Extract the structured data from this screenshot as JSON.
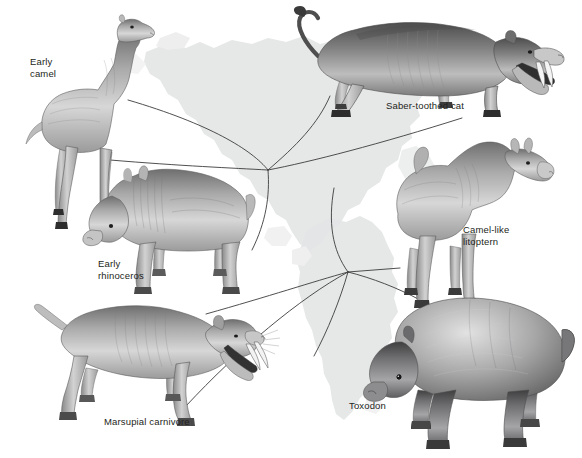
{
  "figure": {
    "background_color": "#ffffff",
    "ink_color": "#231f20",
    "map_fill": "#e2e3e4",
    "line_color": "#3a3a3a"
  },
  "labels": {
    "early_camel": "Early\ncamel",
    "saber_toothed_cat": "Saber-toothed cat",
    "early_rhinoceros": "Early\nrhinoceros",
    "camel_like_litoptern": "Camel-like\nlitoptern",
    "marsupial_carnivore": "Marsupial carnivore",
    "toxodon": "Toxodon"
  },
  "animals": [
    {
      "id": "early-camel",
      "label": "Early camel",
      "continent": "North America",
      "facing": "right"
    },
    {
      "id": "saber-toothed-cat",
      "label": "Saber-toothed cat",
      "continent": "North America",
      "facing": "right"
    },
    {
      "id": "early-rhinoceros",
      "label": "Early rhinoceros",
      "continent": "North America",
      "facing": "left"
    },
    {
      "id": "camel-like-litoptern",
      "label": "Camel-like litoptern",
      "continent": "South America",
      "facing": "right"
    },
    {
      "id": "marsupial-carnivore",
      "label": "Marsupial carnivore",
      "continent": "South America",
      "facing": "right"
    },
    {
      "id": "toxodon",
      "label": "Toxodon",
      "continent": "South America",
      "facing": "left"
    }
  ],
  "maps": [
    {
      "id": "north-america-silhouette",
      "label": "North America"
    },
    {
      "id": "south-america-silhouette",
      "label": "South America"
    }
  ],
  "hubs": [
    {
      "id": "north-america-hub",
      "x": 268,
      "y": 170,
      "rays": 5
    },
    {
      "id": "south-america-hub",
      "x": 348,
      "y": 272,
      "rays": 6
    }
  ]
}
